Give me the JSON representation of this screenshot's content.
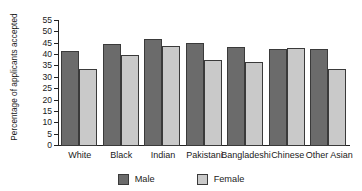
{
  "chart_data": {
    "type": "bar",
    "title": "",
    "subtitle": "",
    "xlabel": "",
    "ylabel": "Percentage of applicants accepted",
    "ylim": [
      0,
      55
    ],
    "ytick_step": 5,
    "yticks": [
      55,
      50,
      45,
      40,
      35,
      30,
      25,
      20,
      15,
      10,
      5,
      0
    ],
    "grid": false,
    "legend_position": "bottom-center",
    "categories": [
      "White",
      "Black",
      "Indian",
      "Pakistani",
      "Bangladeshi",
      "Chinese",
      "Other Asian"
    ],
    "series": [
      {
        "name": "Male",
        "color": "#6b6b6b",
        "values": [
          42,
          45,
          47,
          45.5,
          43.5,
          42.8,
          42.8
        ]
      },
      {
        "name": "Female",
        "color": "#c9c9c9",
        "values": [
          34,
          40,
          44,
          38,
          37,
          43.3,
          34
        ]
      }
    ],
    "annotations": []
  },
  "legend": {
    "items": [
      {
        "label": "Male",
        "swatch": "male-swatch"
      },
      {
        "label": "Female",
        "swatch": "female-swatch"
      }
    ]
  },
  "colors": {
    "male": "#6b6b6b",
    "female": "#c9c9c9",
    "axis": "#222222",
    "background": "#ffffff",
    "bar_outline": "#3a3a3a"
  }
}
